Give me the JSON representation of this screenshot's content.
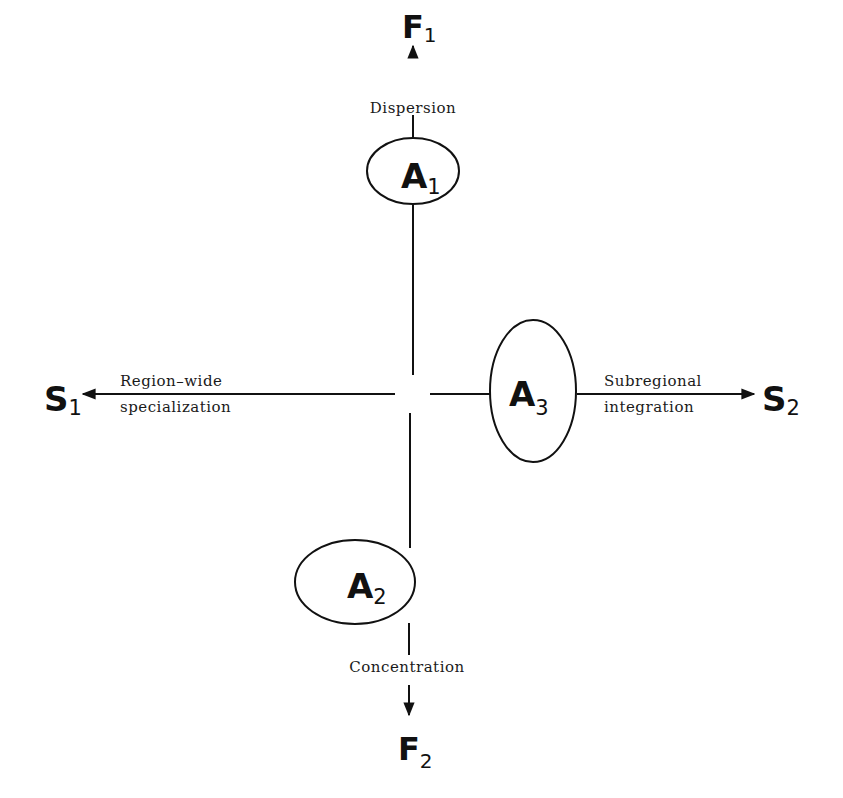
{
  "diagram": {
    "nodes": {
      "F1": {
        "main": "F",
        "sub": "1"
      },
      "F2": {
        "main": "F",
        "sub": "2"
      },
      "S1": {
        "main": "S",
        "sub": "1"
      },
      "S2": {
        "main": "S",
        "sub": "2"
      },
      "A1": {
        "main": "A",
        "sub": "1"
      },
      "A2": {
        "main": "A",
        "sub": "2"
      },
      "A3": {
        "main": "A",
        "sub": "3"
      }
    },
    "labels": {
      "up": "Dispersion",
      "down": "Concentration",
      "left_line1": "Region–wide",
      "left_line2": "specialization",
      "right_line1": "Subregional",
      "right_line2": "integration"
    },
    "colors": {
      "stroke": "#111111",
      "background": "#ffffff"
    }
  }
}
